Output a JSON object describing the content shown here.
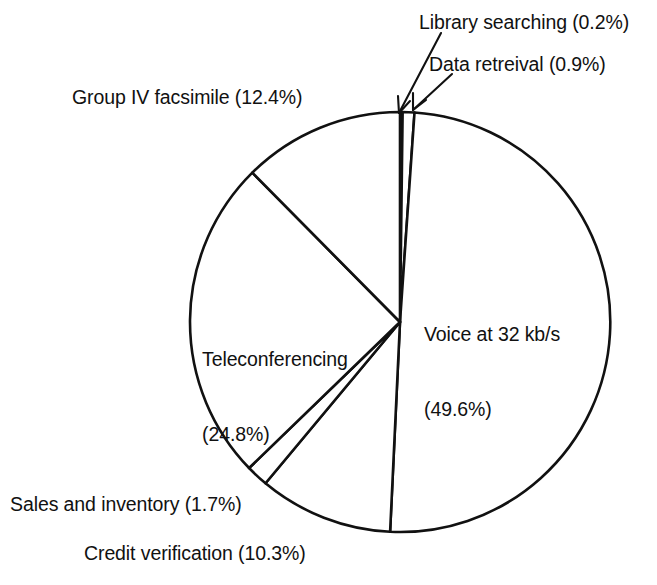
{
  "chart_data": {
    "type": "pie",
    "title": "",
    "subtitle": "",
    "xlabel": "",
    "ylabel": "",
    "legend_position": "none",
    "grid": false,
    "units": "percent",
    "total": 99.9,
    "start_angle_deg": 0,
    "direction": "clockwise",
    "categories": [
      "Library searching",
      "Data retreival",
      "Voice at 32 kb/s",
      "Credit verification",
      "Sales and inventory",
      "Teleconferencing",
      "Group IV facsimile"
    ],
    "values": [
      0.2,
      0.9,
      49.6,
      10.3,
      1.7,
      24.8,
      12.4
    ],
    "slices": [
      {
        "name": "Library searching",
        "value": 0.2,
        "value_text": "0.2%",
        "label": "Library searching (0.2%)",
        "fill": "#111111",
        "fill_style": "solid",
        "has_leader_line": true
      },
      {
        "name": "Data retreival",
        "value": 0.9,
        "value_text": "0.9%",
        "label": "Data retreival (0.9%)",
        "fill": "#ffffff",
        "fill_style": "outline",
        "has_leader_line": true
      },
      {
        "name": "Voice at 32 kb/s",
        "value": 49.6,
        "value_text": "49.6%",
        "label_line1": "Voice at 32 kb/s",
        "label_line2": "(49.6%)",
        "fill": "#ffffff",
        "fill_style": "outline",
        "has_leader_line": false
      },
      {
        "name": "Credit verification",
        "value": 10.3,
        "value_text": "10.3%",
        "label": "Credit verification (10.3%)",
        "fill": "#ffffff",
        "fill_style": "outline",
        "has_leader_line": false
      },
      {
        "name": "Sales and inventory",
        "value": 1.7,
        "value_text": "1.7%",
        "label": "Sales and inventory (1.7%)",
        "fill": "#ffffff",
        "fill_style": "outline",
        "has_leader_line": false
      },
      {
        "name": "Teleconferencing",
        "value": 24.8,
        "value_text": "24.8%",
        "label_line1": "Teleconferencing",
        "label_line2": "(24.8%)",
        "fill": "#ffffff",
        "fill_style": "outline",
        "has_leader_line": false
      },
      {
        "name": "Group IV facsimile",
        "value": 12.4,
        "value_text": "12.4%",
        "label": "Group IV facsimile (12.4%)",
        "fill": "#ffffff",
        "fill_style": "outline",
        "has_leader_line": false
      }
    ],
    "colors": {
      "stroke": "#111111",
      "background": "#ffffff",
      "solid_slice": "#111111"
    }
  },
  "labels": {
    "library_searching": "Library searching (0.2%)",
    "data_retrieval": "Data retreival (0.9%)",
    "group_iv_facsimile": "Group IV facsimile (12.4%)",
    "teleconferencing_l1": "Teleconferencing",
    "teleconferencing_l2": "(24.8%)",
    "voice_l1": "Voice at 32 kb/s",
    "voice_l2": "(49.6%)",
    "sales_and_inventory": "Sales and inventory (1.7%)",
    "credit_verification": "Credit verification (10.3%)"
  },
  "geometry": {
    "center_x": 400,
    "center_y": 322,
    "radius": 210
  }
}
